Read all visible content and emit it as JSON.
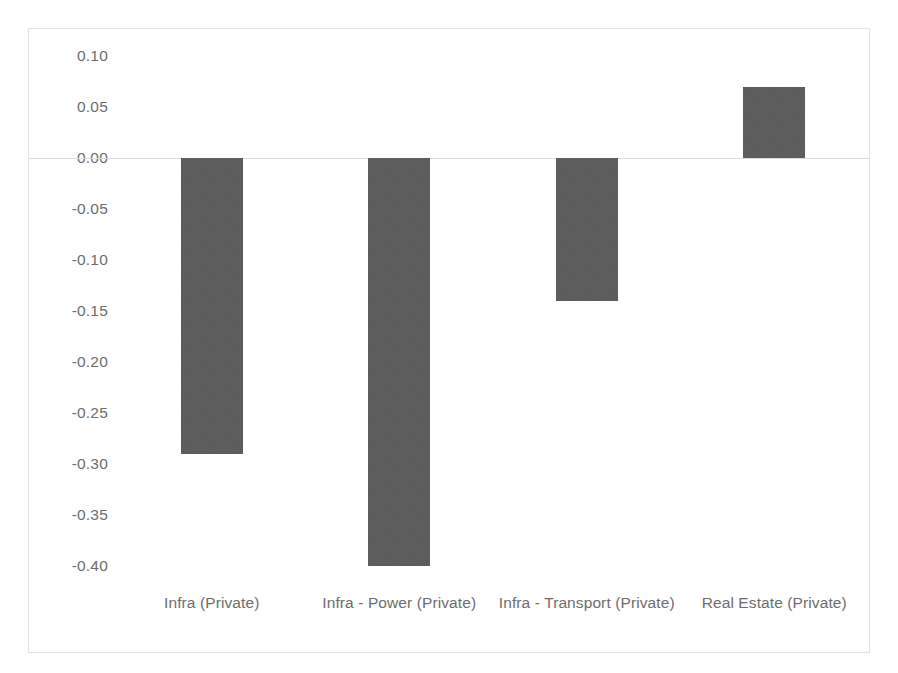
{
  "chart_data": {
    "type": "bar",
    "title": "",
    "subtitle": "",
    "xlabel": "",
    "ylabel": "",
    "categories": [
      "Infra (Private)",
      "Infra - Power (Private)",
      "Infra - Transport (Private)",
      "Real Estate (Private)"
    ],
    "values": [
      -0.29,
      -0.4,
      -0.14,
      0.07
    ],
    "ylim": [
      -0.4,
      0.1
    ],
    "ytick_labels": [
      "0.10",
      "0.05",
      "0.00",
      "-0.05",
      "-0.10",
      "-0.15",
      "-0.20",
      "-0.25",
      "-0.30",
      "-0.35",
      "-0.40"
    ],
    "ytick_values": [
      0.1,
      0.05,
      0.0,
      -0.05,
      -0.1,
      -0.15,
      -0.2,
      -0.25,
      -0.3,
      -0.35,
      -0.4
    ],
    "ytick_step": 0.05,
    "grid": false,
    "zero_line": true,
    "legend": false,
    "legend_position": "none",
    "series_color": "#595959",
    "axis_text_color": "#6d6d6d",
    "zero_line_color": "#dcdcdc",
    "frame_color": "#e3e3e3",
    "background_color": "#ffffff",
    "bar_width_px": 62
  }
}
